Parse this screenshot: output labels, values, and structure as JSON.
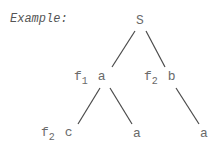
{
  "title": "Example:",
  "tree": {
    "root": {
      "label": "S"
    },
    "level1": [
      {
        "func": "f",
        "sub": "1",
        "label": "a"
      },
      {
        "func": "f",
        "sub": "2",
        "label": "b"
      }
    ],
    "level2": [
      {
        "func": "f",
        "sub": "2",
        "label": "c"
      },
      {
        "label": "a"
      },
      {
        "label": "a"
      }
    ]
  }
}
